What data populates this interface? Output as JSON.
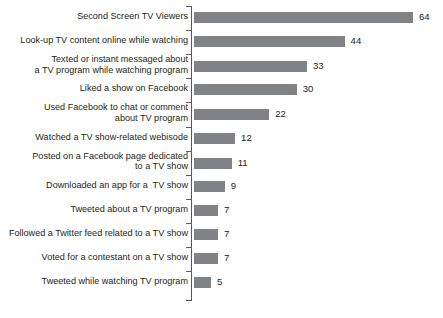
{
  "chart_data": {
    "type": "bar",
    "orientation": "horizontal",
    "title": "",
    "subtitle": "",
    "xlabel": "",
    "ylabel": "",
    "xlim": [
      0,
      64
    ],
    "grid": false,
    "legend": null,
    "bar_color": "#808285",
    "axis_color": "#58595b",
    "text_color": "#231f20",
    "background": "#ffffff",
    "categories": [
      "Second Screen TV Viewers",
      "Look-up TV content online while watching",
      "Texted or instant messaged about\na TV program while watching program",
      "Liked a show on Facebook",
      "Used Facebook to chat or comment\nabout TV program",
      "Watched a TV show-related webisode",
      "Posted on a Facebook page dedicated\nto a TV show",
      "Downloaded an app for a  TV show",
      "Tweeted about a TV program",
      "Followed a Twitter feed related to a TV show",
      "Voted for a contestant on a TV show",
      "Tweeted while watching TV program"
    ],
    "values": [
      64,
      44,
      33,
      30,
      22,
      12,
      11,
      9,
      7,
      7,
      7,
      5
    ],
    "value_labels": [
      "64",
      "44",
      "33",
      "30",
      "22",
      "12",
      "11",
      "9",
      "7",
      "7",
      "7",
      "5"
    ]
  },
  "footnote": {
    "text": ""
  }
}
